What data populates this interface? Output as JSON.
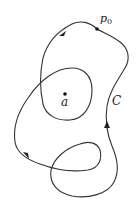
{
  "diagram": {
    "type": "closed curve winding around a point",
    "curve_label": "C",
    "start_point_label": "p",
    "start_point_subscript": "0",
    "center_point_label": "a",
    "colors": {
      "stroke": "#333333",
      "background": "#ffffff"
    },
    "arrows": 3
  }
}
